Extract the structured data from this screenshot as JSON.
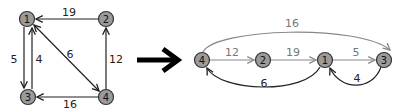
{
  "left_graph": {
    "nodes": [
      {
        "id": "1",
        "label": "1"
      },
      {
        "id": "2",
        "label": "2"
      },
      {
        "id": "3",
        "label": "3"
      },
      {
        "id": "4",
        "label": "4"
      }
    ],
    "edges": [
      {
        "from": "2",
        "to": "1",
        "weight": "19"
      },
      {
        "from": "1",
        "to": "3",
        "weight": "5"
      },
      {
        "from": "3",
        "to": "1",
        "weight": "4"
      },
      {
        "from": "1",
        "to": "4",
        "weight": "6"
      },
      {
        "from": "4",
        "to": "2",
        "weight": "12"
      },
      {
        "from": "4",
        "to": "3",
        "weight": "16"
      }
    ]
  },
  "transform_arrow": "right-arrow",
  "right_graph": {
    "nodes": [
      {
        "id": "4",
        "label": "4"
      },
      {
        "id": "2",
        "label": "2"
      },
      {
        "id": "1",
        "label": "1"
      },
      {
        "id": "3",
        "label": "3"
      }
    ],
    "edges": [
      {
        "from": "4",
        "to": "2",
        "weight": "12",
        "style": "gray"
      },
      {
        "from": "2",
        "to": "1",
        "weight": "19",
        "style": "gray"
      },
      {
        "from": "1",
        "to": "3",
        "weight": "5",
        "style": "gray"
      },
      {
        "from": "4",
        "to": "3",
        "weight": "16",
        "style": "gray"
      },
      {
        "from": "1",
        "to": "4",
        "weight": "6",
        "style": "dark"
      },
      {
        "from": "3",
        "to": "1",
        "weight": "4",
        "style": "dark"
      }
    ]
  },
  "colors": {
    "node_fill": "#9a9a9a",
    "node_stroke": "#333333",
    "edge_dark": "#222222",
    "edge_gray": "#888888"
  }
}
